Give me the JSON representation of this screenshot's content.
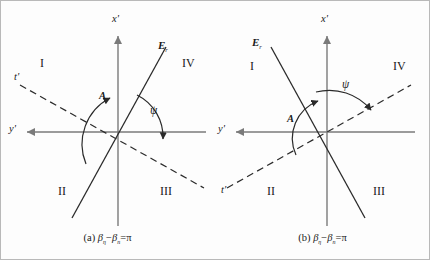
{
  "figure": {
    "background_color": "#fdfdfd",
    "border_color": "#b9b9b9",
    "line_color": "#3a3a3a",
    "axis_color": "#7a7a7a",
    "text_color": "#1a1a1a"
  },
  "panels": [
    {
      "id": "a",
      "caption": {
        "prefix": "(a)",
        "beta1": "β",
        "beta1_sub": "η",
        "minus": "−",
        "beta2": "β",
        "beta2_sub": "n",
        "equals": "=",
        "value": "π"
      },
      "axes": {
        "vertical_label": "x'",
        "horizontal_label": "y'",
        "dashed_label": "t'"
      },
      "field_label": {
        "symbol": "E",
        "subscript": "r"
      },
      "quadrants": [
        {
          "name": "I",
          "label": "I"
        },
        {
          "name": "II",
          "label": "II"
        },
        {
          "name": "III",
          "label": "III"
        },
        {
          "name": "IV",
          "label": "IV"
        }
      ],
      "angles": [
        {
          "name": "A",
          "label": "A"
        },
        {
          "name": "psi",
          "label": "ψ"
        }
      ]
    },
    {
      "id": "b",
      "caption": {
        "prefix": "(b)",
        "beta1": "β",
        "beta1_sub": "η",
        "minus": "−",
        "beta2": "β",
        "beta2_sub": "n",
        "equals": "=",
        "value": "π"
      },
      "axes": {
        "vertical_label": "x'",
        "horizontal_label": "y'",
        "dashed_label": "t'"
      },
      "field_label": {
        "symbol": "E",
        "subscript": "r"
      },
      "quadrants": [
        {
          "name": "I",
          "label": "I"
        },
        {
          "name": "II",
          "label": "II"
        },
        {
          "name": "III",
          "label": "III"
        },
        {
          "name": "IV",
          "label": "IV"
        }
      ],
      "angles": [
        {
          "name": "A",
          "label": "A"
        },
        {
          "name": "psi",
          "label": "ψ"
        }
      ]
    }
  ]
}
